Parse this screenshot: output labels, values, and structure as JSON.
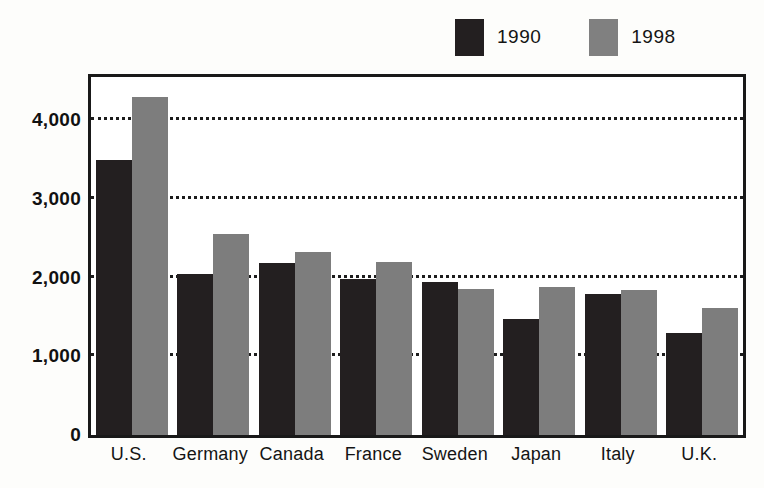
{
  "chart_data": {
    "type": "bar",
    "title": "",
    "subtitle": "",
    "xlabel": "",
    "ylabel": "",
    "categories": [
      "U.S.",
      "Germany",
      "Canada",
      "France",
      "Sweden",
      "Japan",
      "Italy",
      "U.K."
    ],
    "series": [
      {
        "name": "1990",
        "color": "#231f20",
        "values": [
          3500,
          2050,
          2180,
          1980,
          1940,
          1480,
          1790,
          1300
        ]
      },
      {
        "name": "1998",
        "color": "#7d7d7d",
        "values": [
          4300,
          2550,
          2320,
          2200,
          1860,
          1880,
          1840,
          1620
        ]
      }
    ],
    "ylim": [
      0,
      4550
    ],
    "yticks": [
      0,
      1000,
      2000,
      3000,
      4000
    ],
    "ytick_labels": [
      "0",
      "1,000",
      "2,000",
      "3,000",
      "4,000"
    ],
    "grid": true,
    "grid_axis": "y",
    "grid_style": "dotted",
    "legend_position": "top-right",
    "legend": [
      {
        "label": "1990",
        "color": "#231f20"
      },
      {
        "label": "1998",
        "color": "#7d7d7d"
      }
    ]
  },
  "colors": {
    "series_1990": "#231f20",
    "series_1998": "#7d7d7d",
    "axis": "#191919",
    "grid": "#1c1c1c",
    "background": "#ffffff"
  }
}
